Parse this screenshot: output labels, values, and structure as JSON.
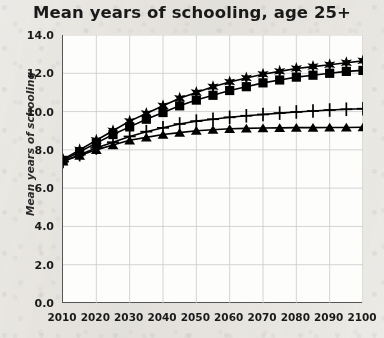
{
  "chart_data": {
    "type": "line",
    "title": "Mean years of schooling, age 25+",
    "xlabel": "",
    "ylabel": "Mean years of schooling",
    "xlim": [
      2010,
      2100
    ],
    "ylim": [
      0.0,
      14.0
    ],
    "grid": true,
    "legend": "none",
    "y_ticks": [
      "14.0",
      "12.0",
      "10.0",
      "8.0",
      "6.0",
      "4.0",
      "2.0",
      "0.0"
    ],
    "y_tick_values": [
      14.0,
      12.0,
      10.0,
      8.0,
      6.0,
      4.0,
      2.0,
      0.0
    ],
    "x_ticks": [
      "2010",
      "2020",
      "2030",
      "2040",
      "2050",
      "2060",
      "2070",
      "2080",
      "2090",
      "2100"
    ],
    "x_tick_values": [
      2010,
      2020,
      2030,
      2040,
      2050,
      2060,
      2070,
      2080,
      2090,
      2100
    ],
    "x": [
      2010,
      2015,
      2020,
      2025,
      2030,
      2035,
      2040,
      2045,
      2050,
      2055,
      2060,
      2065,
      2070,
      2075,
      2080,
      2085,
      2090,
      2095,
      2100
    ],
    "series": [
      {
        "name": "Fast track",
        "marker": "star",
        "values": [
          7.5,
          8.0,
          8.5,
          9.0,
          9.5,
          9.9,
          10.3,
          10.7,
          11.0,
          11.3,
          11.55,
          11.75,
          11.95,
          12.1,
          12.25,
          12.35,
          12.45,
          12.55,
          12.65
        ]
      },
      {
        "name": "Global education trend",
        "marker": "square",
        "values": [
          7.45,
          7.9,
          8.35,
          8.8,
          9.2,
          9.6,
          9.95,
          10.3,
          10.6,
          10.85,
          11.1,
          11.3,
          11.5,
          11.65,
          11.8,
          11.9,
          12.0,
          12.1,
          12.15
        ]
      },
      {
        "name": "Constant enrollment rates",
        "marker": "plus",
        "values": [
          7.4,
          7.75,
          8.1,
          8.4,
          8.7,
          8.95,
          9.15,
          9.35,
          9.5,
          9.6,
          9.7,
          9.78,
          9.85,
          9.92,
          9.98,
          10.03,
          10.08,
          10.12,
          10.15
        ]
      },
      {
        "name": "Constant enrollment numbers",
        "marker": "triangle",
        "values": [
          7.4,
          7.7,
          8.0,
          8.25,
          8.5,
          8.65,
          8.8,
          8.9,
          9.0,
          9.05,
          9.1,
          9.12,
          9.14,
          9.15,
          9.16,
          9.16,
          9.17,
          9.17,
          9.18
        ]
      }
    ],
    "colors": {
      "series": "#000000",
      "plot_background": "#fdfdfc",
      "page_background": "#eceae6",
      "gridline": "#c9c9c9",
      "axis": "#555555",
      "text": "#1a1a1a"
    }
  }
}
